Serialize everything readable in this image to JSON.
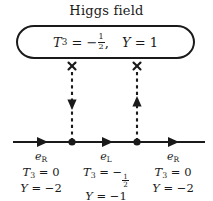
{
  "diagram": {
    "title": "Higgs field",
    "type": "feynman-like-vertex-diagram",
    "higgs_box": {
      "quantum_numbers": "T_3 = -1/2,  Y = 1",
      "t3_symbol": "T",
      "t3_sub": "3",
      "t3_eq": "=",
      "t3_sign": "−",
      "t3_numer": "1",
      "t3_denom": "2",
      "comma": ",",
      "y_symbol": "Y",
      "y_eq": "=",
      "y_value": "1"
    },
    "vertices": [
      {
        "name": "vertex-left",
        "x": 72,
        "marker": "x-mark",
        "arrow_direction": "down"
      },
      {
        "name": "vertex-right",
        "x": 137,
        "marker": "x-mark",
        "arrow_direction": "up"
      }
    ],
    "fermion_line": {
      "y": 142,
      "x_start": 13,
      "x_end": 205,
      "arrow_positions": [
        42,
        107,
        173
      ],
      "arrow_direction": "right"
    },
    "segments": [
      {
        "id": "left",
        "particle": "e",
        "particle_sub": "R",
        "t3_symbol": "T",
        "t3_sub": "3",
        "t3_eq": "=",
        "t3_value": "0",
        "y_symbol": "Y",
        "y_eq": "=",
        "y_value": "−2",
        "t3_is_fraction": false
      },
      {
        "id": "middle",
        "particle": "e",
        "particle_sub": "L",
        "t3_symbol": "T",
        "t3_sub": "3",
        "t3_eq": "=",
        "t3_sign": "−",
        "t3_numer": "1",
        "t3_denom": "2",
        "y_symbol": "Y",
        "y_eq": "=",
        "y_value": "−1",
        "t3_is_fraction": true
      },
      {
        "id": "right",
        "particle": "e",
        "particle_sub": "R",
        "t3_symbol": "T",
        "t3_sub": "3",
        "t3_eq": "=",
        "t3_value": "0",
        "y_symbol": "Y",
        "y_eq": "=",
        "y_value": "−2",
        "t3_is_fraction": false
      }
    ],
    "colors": {
      "ink": "#1a1a1a",
      "background": "#ffffff"
    }
  }
}
